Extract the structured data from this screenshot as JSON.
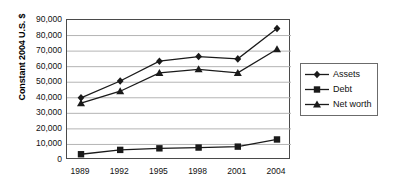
{
  "chart_data": {
    "type": "line",
    "title": "",
    "xlabel": "",
    "ylabel": "Constant 2004 U.S. $",
    "categories": [
      "1989",
      "1992",
      "1995",
      "1998",
      "2001",
      "2004"
    ],
    "ylim": [
      0,
      90000
    ],
    "ytick_step": 10000,
    "ytick_labels": [
      "90,000",
      "80,000",
      "70,000",
      "60,000",
      "50,000",
      "40,000",
      "30,000",
      "20,000",
      "10,000",
      "0"
    ],
    "ytick_values": [
      90000,
      80000,
      70000,
      60000,
      50000,
      40000,
      30000,
      20000,
      10000,
      0
    ],
    "grid": "horizontal",
    "legend_position": "right",
    "series": [
      {
        "name": "Assets",
        "marker": "diamond",
        "color": "#1a1a1a",
        "values": [
          40000,
          50800,
          63500,
          66500,
          65000,
          84500
        ]
      },
      {
        "name": "Debt",
        "marker": "square",
        "color": "#1a1a1a",
        "values": [
          3700,
          6500,
          7500,
          8000,
          8600,
          13200
        ]
      },
      {
        "name": "Net worth",
        "marker": "triangle",
        "color": "#1a1a1a",
        "values": [
          36500,
          44200,
          56000,
          58300,
          56000,
          71200
        ]
      }
    ]
  },
  "colors": {
    "series_line": "#1a1a1a",
    "gridline": "#b4b4b4",
    "axis_border": "#4a4a4a",
    "legend_border": "#6b6b6b",
    "background": "#ffffff",
    "text": "#111111"
  }
}
